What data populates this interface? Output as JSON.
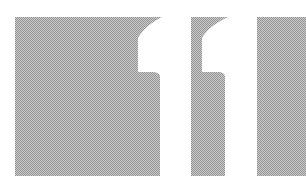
{
  "graphic": {
    "label": "11",
    "description": "Large white numeral 11 knocked out of three dithered gray panels",
    "colors": {
      "background": "#ffffff",
      "panel_light": "#c9c9c9",
      "panel_dark": "#969696",
      "numeral": "#ffffff"
    }
  }
}
